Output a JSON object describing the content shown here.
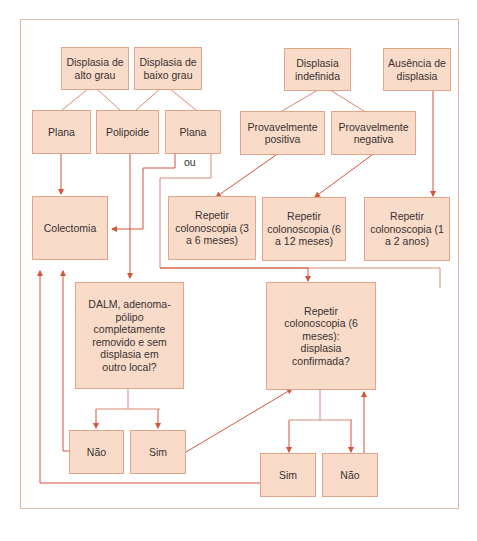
{
  "diagram": {
    "nodes": {
      "alto_grau": "Displasia de alto grau",
      "baixo_grau": "Displasia de baixo grau",
      "indefinida": "Displasia indefinida",
      "ausencia": "Ausência de displasia",
      "plana1": "Plana",
      "polipoide": "Polipoide",
      "plana2": "Plana",
      "prov_positiva": "Provavelmente positiva",
      "prov_negativa": "Provavelmente negativa",
      "colectomia": "Colectomia",
      "repetir_3_6": "Repetir colonoscopia (3 a 6 meses)",
      "repetir_6_12": "Repetir colonoscopia (6 a 12 meses)",
      "repetir_1_2": "Repetir colonoscopia (1 a 2 anos)",
      "dalm": "DALM, adenoma-pólipo completamente removido e sem displasia em outro local?",
      "repetir_6": "Repetir colonoscopia (6 meses): displasia confirmada?",
      "nao1": "Não",
      "sim1": "Sim",
      "sim2": "Sim",
      "nao2": "Não"
    },
    "or_label": "ou"
  },
  "colors": {
    "box_fill": "#f8dcc9",
    "box_border": "#e3a58a",
    "arrow": "#d2553a",
    "frame": "#e0b8a8"
  }
}
